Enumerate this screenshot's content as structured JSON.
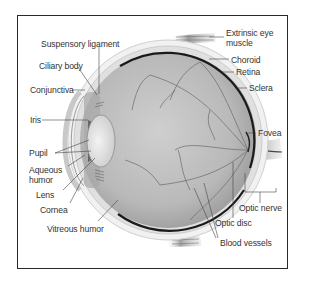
{
  "diagram": {
    "type": "anatomical-cross-section",
    "labels_left": [
      {
        "id": "suspensory-ligament",
        "text": "Suspensory ligament",
        "x": 41,
        "y": 40
      },
      {
        "id": "ciliary-body",
        "text": "Ciliary body",
        "x": 39,
        "y": 62
      },
      {
        "id": "conjunctiva",
        "text": "Conjunctiva",
        "x": 30,
        "y": 86
      },
      {
        "id": "iris",
        "text": "Iris",
        "x": 30,
        "y": 116
      },
      {
        "id": "pupil",
        "text": "Pupil",
        "x": 29,
        "y": 149
      },
      {
        "id": "aqueous-humor-1",
        "text": "Aqueous",
        "x": 29,
        "y": 166
      },
      {
        "id": "aqueous-humor-2",
        "text": "humor",
        "x": 29,
        "y": 176
      },
      {
        "id": "lens",
        "text": "Lens",
        "x": 36,
        "y": 191
      },
      {
        "id": "cornea",
        "text": "Cornea",
        "x": 40,
        "y": 206
      },
      {
        "id": "vitreous-humor",
        "text": "Vitreous humor",
        "x": 47,
        "y": 225
      }
    ],
    "labels_right": [
      {
        "id": "extrinsic-eye-muscle-1",
        "text": "Extrinsic eye",
        "x": 226,
        "y": 29
      },
      {
        "id": "extrinsic-eye-muscle-2",
        "text": "muscle",
        "x": 226,
        "y": 39
      },
      {
        "id": "choroid",
        "text": "Choroid",
        "x": 231,
        "y": 56
      },
      {
        "id": "retina",
        "text": "Retina",
        "x": 236,
        "y": 70
      },
      {
        "id": "sclera",
        "text": "Sclera",
        "x": 249,
        "y": 85
      },
      {
        "id": "fovea",
        "text": "Fovea",
        "x": 258,
        "y": 130
      },
      {
        "id": "optic-nerve",
        "text": "Optic nerve",
        "x": 239,
        "y": 205
      },
      {
        "id": "optic-disc",
        "text": "Optic disc",
        "x": 215,
        "y": 220
      },
      {
        "id": "blood-vessels",
        "text": "Blood vessels",
        "x": 220,
        "y": 240
      }
    ],
    "colors": {
      "frame": "#2a2a2a",
      "label_text": "#333333",
      "leader_line": "#444444",
      "globe_fill": "#bdbdbd",
      "choroid_edge": "#1a1a1a",
      "sclera": "#e6e6e6",
      "vessel": "#6a6a6a",
      "lens": "#e2e2e2"
    }
  }
}
